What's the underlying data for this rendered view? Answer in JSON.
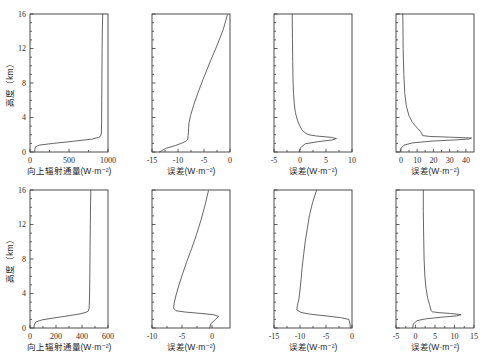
{
  "figure": {
    "ylabel": "高度（km）",
    "y_ticks": [
      0,
      4,
      8,
      12,
      16
    ],
    "y_range": [
      0,
      16
    ]
  },
  "chart_data": [
    {
      "id": "r1c1",
      "type": "line",
      "title": "",
      "xlabel": "向上辐射通量(W·m⁻²)",
      "ylabel": "高度（km）",
      "xlim": [
        0,
        1000
      ],
      "ylim": [
        0,
        16
      ],
      "xticks": [
        0,
        500,
        1000
      ],
      "xticklabels": [
        "0",
        "500",
        "1000"
      ],
      "yticks": [
        0,
        4,
        8,
        12,
        16
      ],
      "yticklabels": [
        "0",
        "4",
        "8",
        "12",
        "16"
      ],
      "grid": false,
      "legend": "none",
      "series": [
        {
          "name": "upward flux",
          "x": [
            60,
            62,
            70,
            120,
            300,
            560,
            800,
            880,
            905,
            915,
            918,
            920,
            922,
            925,
            928,
            932
          ],
          "y": [
            0,
            0.3,
            0.6,
            0.8,
            1.0,
            1.25,
            1.5,
            1.7,
            1.85,
            2.2,
            3.5,
            6.0,
            9.0,
            12.0,
            14.5,
            16.0
          ]
        }
      ]
    },
    {
      "id": "r1c2",
      "type": "line",
      "title": "",
      "xlabel": "误差(W·m⁻²)",
      "ylabel": "",
      "xlim": [
        -15,
        0
      ],
      "ylim": [
        0,
        16
      ],
      "xticks": [
        -15,
        -10,
        -5,
        0
      ],
      "xticklabels": [
        "-15",
        "-10",
        "-5",
        "0"
      ],
      "yticks": [
        0,
        4,
        8,
        12,
        16
      ],
      "yticklabels": [
        "",
        "",
        "",
        "",
        ""
      ],
      "grid": false,
      "legend": "none",
      "series": [
        {
          "name": "error",
          "x": [
            -13.6,
            -12.2,
            -10.5,
            -9.4,
            -8.6,
            -8.2,
            -8.1,
            -8.05,
            -8.0,
            -7.95,
            -7.9,
            -7.6,
            -7.0,
            -6.2,
            -5.2,
            -4.0,
            -2.6,
            -1.3,
            -0.5
          ],
          "y": [
            0,
            0.45,
            0.75,
            1.0,
            1.2,
            1.4,
            1.6,
            1.9,
            2.3,
            2.8,
            3.3,
            4.2,
            5.4,
            6.8,
            8.4,
            10.2,
            12.2,
            14.2,
            15.9
          ]
        }
      ]
    },
    {
      "id": "r1c3",
      "type": "line",
      "title": "",
      "xlabel": "误差(W·m⁻²)",
      "ylabel": "",
      "xlim": [
        -5,
        10
      ],
      "ylim": [
        0,
        16
      ],
      "xticks": [
        -5,
        0,
        5,
        10
      ],
      "xticklabels": [
        "-5",
        "0",
        "5",
        "10"
      ],
      "yticks": [
        0,
        4,
        8,
        12,
        16
      ],
      "yticklabels": [
        "",
        "",
        "",
        "",
        ""
      ],
      "grid": false,
      "legend": "none",
      "series": [
        {
          "name": "error",
          "x": [
            -0.2,
            0.1,
            1.0,
            3.5,
            6.2,
            7.0,
            6.0,
            3.2,
            1.7,
            1.0,
            0.35,
            -0.1,
            -0.5,
            -0.9,
            -1.1,
            -1.25,
            -1.35,
            -1.4,
            -1.45,
            -1.5
          ],
          "y": [
            0,
            0.5,
            0.95,
            1.2,
            1.4,
            1.55,
            1.7,
            1.85,
            2.0,
            2.2,
            2.6,
            3.1,
            3.7,
            4.6,
            5.6,
            6.8,
            8.5,
            10.5,
            13.0,
            16.0
          ]
        }
      ]
    },
    {
      "id": "r1c4",
      "type": "line",
      "title": "",
      "xlabel": "误差(W·m⁻²)",
      "ylabel": "",
      "xlim": [
        -3,
        45
      ],
      "ylim": [
        0,
        16
      ],
      "xticks": [
        0,
        10,
        20,
        30,
        40
      ],
      "xticklabels": [
        "0",
        "10",
        "20",
        "30",
        "40"
      ],
      "yticks": [
        0,
        4,
        8,
        12,
        16
      ],
      "yticklabels": [
        "",
        "",
        "",
        "",
        ""
      ],
      "grid": false,
      "legend": "none",
      "series": [
        {
          "name": "error",
          "x": [
            -0.6,
            0.2,
            2.0,
            7.0,
            18.0,
            33.0,
            42.0,
            43.5,
            30.0,
            18.0,
            13.5,
            13.0,
            12.2,
            10.0,
            7.2,
            5.0,
            3.4,
            2.4,
            1.8,
            1.4,
            1.2
          ],
          "y": [
            0,
            0.45,
            0.8,
            1.05,
            1.25,
            1.4,
            1.5,
            1.62,
            1.72,
            1.8,
            1.9,
            2.1,
            2.35,
            2.8,
            3.4,
            4.2,
            5.3,
            6.8,
            9.0,
            12.0,
            16.0
          ]
        }
      ]
    },
    {
      "id": "r2c1",
      "type": "line",
      "title": "",
      "xlabel": "向上辐射通量(W·m⁻²)",
      "ylabel": "高度（km）",
      "xlim": [
        0,
        600
      ],
      "ylim": [
        0,
        16
      ],
      "xticks": [
        0,
        200,
        400,
        600
      ],
      "xticklabels": [
        "0",
        "200",
        "400",
        "600"
      ],
      "yticks": [
        0,
        4,
        8,
        12,
        16
      ],
      "yticklabels": [
        "0",
        "4",
        "8",
        "12",
        "16"
      ],
      "grid": false,
      "legend": "none",
      "series": [
        {
          "name": "upward flux",
          "x": [
            30,
            33,
            45,
            95,
            200,
            310,
            390,
            430,
            448,
            455,
            458,
            460,
            462,
            464,
            466,
            468
          ],
          "y": [
            0,
            0.35,
            0.7,
            0.95,
            1.2,
            1.45,
            1.65,
            1.82,
            1.95,
            2.3,
            3.6,
            6.0,
            9.0,
            12.0,
            14.5,
            16.0
          ]
        }
      ]
    },
    {
      "id": "r2c2",
      "type": "line",
      "title": "",
      "xlabel": "误差(W·m⁻²)",
      "ylabel": "",
      "xlim": [
        -10,
        3
      ],
      "ylim": [
        0,
        16
      ],
      "xticks": [
        -10,
        -5,
        0
      ],
      "xticklabels": [
        "-10",
        "-5",
        "0"
      ],
      "yticks": [
        0,
        4,
        8,
        12,
        16
      ],
      "yticklabels": [
        "",
        "",
        "",
        "",
        ""
      ],
      "grid": false,
      "legend": "none",
      "series": [
        {
          "name": "error",
          "x": [
            -0.4,
            -0.2,
            0.6,
            1.1,
            0.2,
            -2.0,
            -4.5,
            -6.0,
            -6.4,
            -6.3,
            -6.0,
            -5.5,
            -4.9,
            -4.2,
            -3.4,
            -2.6,
            -1.8,
            -1.1,
            -0.6
          ],
          "y": [
            0,
            0.5,
            1.0,
            1.35,
            1.55,
            1.7,
            1.85,
            2.0,
            2.3,
            2.9,
            3.8,
            5.0,
            6.3,
            7.7,
            9.2,
            10.8,
            12.6,
            14.4,
            15.9
          ]
        }
      ]
    },
    {
      "id": "r2c3",
      "type": "line",
      "title": "",
      "xlabel": "误差(W·m⁻²)",
      "ylabel": "",
      "xlim": [
        -15,
        0
      ],
      "ylim": [
        0,
        16
      ],
      "xticks": [
        -15,
        -10,
        -5,
        0
      ],
      "xticklabels": [
        "-15",
        "-10",
        "-5",
        "0"
      ],
      "yticks": [
        0,
        4,
        8,
        12,
        16
      ],
      "yticklabels": [
        "",
        "",
        "",
        "",
        ""
      ],
      "grid": false,
      "legend": "none",
      "series": [
        {
          "name": "error",
          "x": [
            -0.3,
            -0.4,
            -0.6,
            -2.2,
            -5.0,
            -8.0,
            -9.8,
            -10.6,
            -10.5,
            -10.2,
            -10.0,
            -9.8,
            -9.6,
            -9.3,
            -9.0,
            -8.6,
            -8.2,
            -7.6,
            -6.8
          ],
          "y": [
            0,
            0.5,
            1.0,
            1.2,
            1.4,
            1.6,
            1.8,
            2.1,
            2.6,
            3.4,
            4.4,
            5.6,
            7.0,
            8.5,
            10.0,
            11.5,
            13.0,
            14.5,
            16.0
          ]
        }
      ]
    },
    {
      "id": "r2c4",
      "type": "line",
      "title": "",
      "xlabel": "误差(W·m⁻²)",
      "ylabel": "",
      "xlim": [
        -5,
        15
      ],
      "ylim": [
        0,
        16
      ],
      "xticks": [
        -5,
        0,
        5,
        10,
        15
      ],
      "xticklabels": [
        "-5",
        "0",
        "5",
        "10",
        "15"
      ],
      "yticks": [
        0,
        4,
        8,
        12,
        16
      ],
      "yticklabels": [
        "",
        "",
        "",
        "",
        ""
      ],
      "grid": false,
      "legend": "none",
      "series": [
        {
          "name": "error",
          "x": [
            -0.7,
            -0.6,
            0.4,
            2.5,
            6.5,
            10.5,
            11.7,
            9.0,
            6.0,
            4.3,
            4.0,
            3.9,
            3.6,
            3.1,
            2.7,
            2.4,
            2.2,
            2.1,
            2.0,
            2.0
          ],
          "y": [
            0,
            0.45,
            0.85,
            1.05,
            1.25,
            1.4,
            1.55,
            1.68,
            1.78,
            1.88,
            2.0,
            2.2,
            2.7,
            3.5,
            4.6,
            6.0,
            8.0,
            10.5,
            13.5,
            16.0
          ]
        }
      ]
    }
  ]
}
